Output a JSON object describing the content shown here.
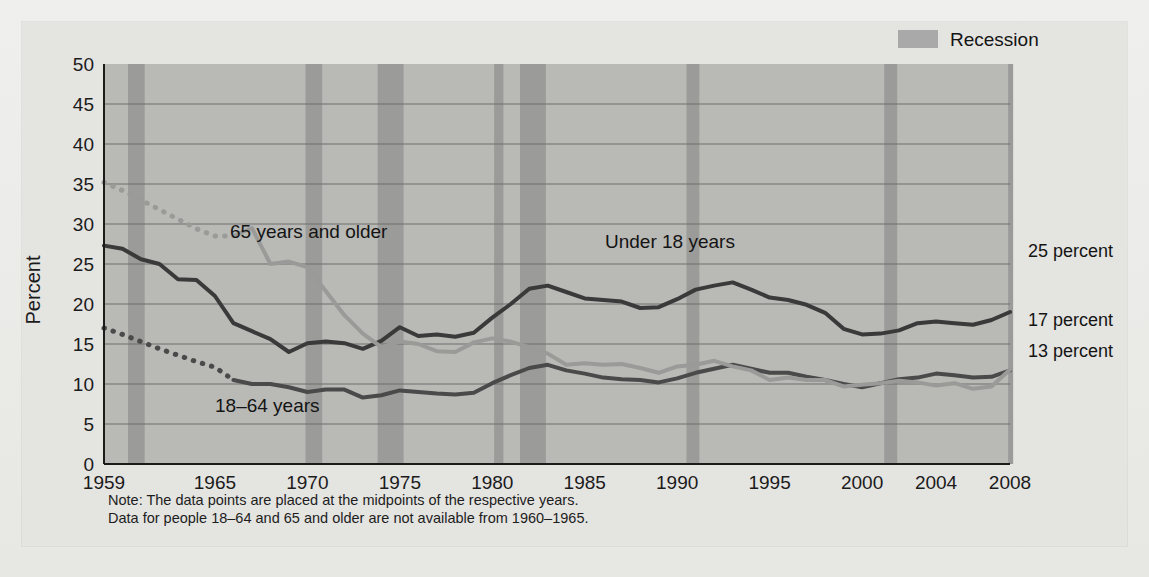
{
  "figure": {
    "ylabel": "Percent",
    "legend": {
      "label": "Recession",
      "swatch_color": "#a9a9a9"
    },
    "notes": [
      "Note: The data points are placed at the midpoints of the respective years.",
      "Data for people 18–64 and 65 and older are not available from 1960–1965."
    ],
    "series_annotations": [
      {
        "text": "65 years and older",
        "x": 230,
        "y": 238
      },
      {
        "text": "18–64 years",
        "x": 215,
        "y": 412
      },
      {
        "text": "Under 18 years",
        "x": 605,
        "y": 248
      }
    ],
    "end_labels": [
      {
        "text": "25 percent",
        "y": 257
      },
      {
        "text": "17 percent",
        "y": 326
      },
      {
        "text": "13 percent",
        "y": 357
      }
    ],
    "colors": {
      "plot_background": "#b9b9b6",
      "recession_band": "#9b9b99",
      "gridline": "#6f6f6d",
      "under18": "#3a3a3a",
      "age18to64": "#4a4a4a",
      "age65plus": "#9a9a98",
      "page_background": "#e9e9e7"
    }
  },
  "chart_data": {
    "type": "line",
    "title": "",
    "xlabel": "",
    "ylabel": "Percent",
    "xlim": [
      1959,
      2008
    ],
    "ylim": [
      0,
      50
    ],
    "yticks": [
      0,
      5,
      10,
      15,
      20,
      25,
      30,
      35,
      40,
      45,
      50
    ],
    "xticks": [
      1959,
      1965,
      1970,
      1975,
      1980,
      1985,
      1990,
      1995,
      2000,
      2004,
      2008
    ],
    "xtick_labels": [
      "1959",
      "1965",
      "1970",
      "1975",
      "1980",
      "1985",
      "1990",
      "1995",
      "2000",
      "2004",
      "2008"
    ],
    "ytick_labels": [
      "0",
      "5",
      "10",
      "15",
      "20",
      "25",
      "30",
      "35",
      "40",
      "45",
      "50"
    ],
    "grid": true,
    "legend_position": "top-right",
    "x": [
      1959,
      1960,
      1961,
      1962,
      1963,
      1964,
      1965,
      1966,
      1967,
      1968,
      1969,
      1970,
      1971,
      1972,
      1973,
      1974,
      1975,
      1976,
      1977,
      1978,
      1979,
      1980,
      1981,
      1982,
      1983,
      1984,
      1985,
      1986,
      1987,
      1988,
      1989,
      1990,
      1991,
      1992,
      1993,
      1994,
      1995,
      1996,
      1997,
      1998,
      1999,
      2000,
      2001,
      2002,
      2003,
      2004,
      2005,
      2006,
      2007,
      2008
    ],
    "series": [
      {
        "name": "Under 18 years",
        "color": "#3a3a3a",
        "style": "solid",
        "end_label": "25 percent",
        "values": [
          27.3,
          26.9,
          25.6,
          25.0,
          23.1,
          23.0,
          21.0,
          17.6,
          16.6,
          15.6,
          14.0,
          15.1,
          15.3,
          15.1,
          14.4,
          15.4,
          17.1,
          16.0,
          16.2,
          15.9,
          16.4,
          18.3,
          20.0,
          21.9,
          22.3,
          21.5,
          20.7,
          20.5,
          20.3,
          19.5,
          19.6,
          20.6,
          21.8,
          22.3,
          22.7,
          21.8,
          20.8,
          20.5,
          19.9,
          18.9,
          16.9,
          16.2,
          16.3,
          16.7,
          17.6,
          17.8,
          17.6,
          17.4,
          18.0,
          19.0
        ]
      },
      {
        "name": "18–64 years",
        "color": "#4a4a4a",
        "style": "dotted-then-solid",
        "dotted_until": 1966,
        "end_label": "17 percent",
        "values": [
          17.0,
          16.2,
          15.3,
          14.4,
          13.6,
          12.8,
          12.1,
          10.5,
          10.0,
          10.0,
          9.6,
          9.0,
          9.3,
          9.3,
          8.3,
          8.6,
          9.2,
          9.0,
          8.8,
          8.7,
          8.9,
          10.1,
          11.1,
          12.0,
          12.4,
          11.7,
          11.3,
          10.8,
          10.6,
          10.5,
          10.2,
          10.7,
          11.4,
          11.9,
          12.4,
          11.9,
          11.4,
          11.4,
          10.9,
          10.5,
          10.0,
          9.6,
          10.1,
          10.6,
          10.8,
          11.3,
          11.1,
          10.8,
          10.9,
          11.7
        ]
      },
      {
        "name": "65 years and older",
        "color": "#9a9a98",
        "style": "dotted-then-solid",
        "dotted_until": 1966,
        "end_label": "13 percent",
        "values": [
          35.2,
          34.2,
          33.0,
          31.8,
          30.6,
          29.4,
          28.5,
          28.5,
          29.5,
          25.0,
          25.3,
          24.6,
          21.6,
          18.6,
          16.3,
          14.6,
          15.3,
          15.0,
          14.1,
          14.0,
          15.2,
          15.7,
          15.3,
          14.6,
          13.8,
          12.4,
          12.6,
          12.4,
          12.5,
          12.0,
          11.4,
          12.2,
          12.4,
          12.9,
          12.2,
          11.7,
          10.5,
          10.8,
          10.5,
          10.5,
          9.7,
          9.9,
          10.1,
          10.4,
          10.2,
          9.8,
          10.1,
          9.4,
          9.7,
          11.8
        ]
      }
    ],
    "recessions": [
      {
        "start": 1960.3,
        "end": 1961.2
      },
      {
        "start": 1969.9,
        "end": 1970.8
      },
      {
        "start": 1973.8,
        "end": 1975.2
      },
      {
        "start": 1980.1,
        "end": 1980.6
      },
      {
        "start": 1981.5,
        "end": 1982.9
      },
      {
        "start": 1990.5,
        "end": 1991.2
      },
      {
        "start": 2001.2,
        "end": 2001.9
      },
      {
        "start": 2007.9,
        "end": 2008.5
      }
    ]
  }
}
